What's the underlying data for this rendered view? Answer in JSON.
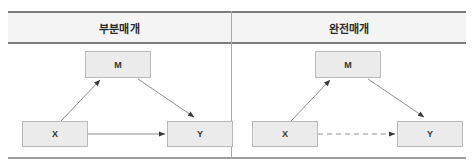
{
  "figure": {
    "columns": [
      {
        "header": "부분매개",
        "diagram": {
          "nodes": [
            {
              "id": "M",
              "label": "M",
              "role": "mediator"
            },
            {
              "id": "X",
              "label": "X",
              "role": "independent"
            },
            {
              "id": "Y",
              "label": "Y",
              "role": "dependent"
            }
          ],
          "edges": [
            {
              "from": "X",
              "to": "M",
              "style": "solid",
              "arrow": true
            },
            {
              "from": "M",
              "to": "Y",
              "style": "solid",
              "arrow": true
            },
            {
              "from": "X",
              "to": "Y",
              "style": "solid",
              "arrow": true
            }
          ]
        }
      },
      {
        "header": "완전매개",
        "diagram": {
          "nodes": [
            {
              "id": "M",
              "label": "M",
              "role": "mediator"
            },
            {
              "id": "X",
              "label": "X",
              "role": "independent"
            },
            {
              "id": "Y",
              "label": "Y",
              "role": "dependent"
            }
          ],
          "edges": [
            {
              "from": "X",
              "to": "M",
              "style": "solid",
              "arrow": true
            },
            {
              "from": "M",
              "to": "Y",
              "style": "solid",
              "arrow": true
            },
            {
              "from": "X",
              "to": "Y",
              "style": "dashed",
              "arrow": true
            }
          ]
        }
      }
    ],
    "colors": {
      "node_fill": "#ebebeb",
      "node_border": "#b9b9b9",
      "edge": "#8f8f8f",
      "rule": "#7d7d7d",
      "header_fill": "#f4f4f4",
      "text": "#2b2b2b"
    }
  }
}
